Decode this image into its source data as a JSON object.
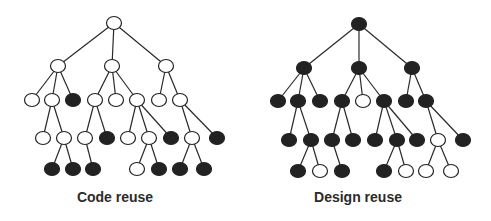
{
  "colors": {
    "filled": "#222222",
    "empty": "#ffffff",
    "edge": "#2a2a2a"
  },
  "node_rx": 7.5,
  "node_ry": 6.5,
  "trees": [
    {
      "id": "code-reuse",
      "caption": "Code reuse",
      "caption_center_x": 115,
      "nodes": [
        {
          "id": "r",
          "x": 114,
          "y": 23,
          "filled": false
        },
        {
          "id": "A",
          "x": 58,
          "y": 66,
          "filled": false,
          "parent": "r"
        },
        {
          "id": "B",
          "x": 112,
          "y": 66,
          "filled": false,
          "parent": "r"
        },
        {
          "id": "C",
          "x": 166,
          "y": 66,
          "filled": false,
          "parent": "r"
        },
        {
          "id": "A1",
          "x": 32,
          "y": 100,
          "filled": false,
          "parent": "A"
        },
        {
          "id": "A2",
          "x": 52,
          "y": 100,
          "filled": false,
          "parent": "A"
        },
        {
          "id": "A3",
          "x": 73,
          "y": 100,
          "filled": true,
          "parent": "A"
        },
        {
          "id": "B1",
          "x": 95,
          "y": 100,
          "filled": false,
          "parent": "B"
        },
        {
          "id": "B2",
          "x": 116,
          "y": 100,
          "filled": false,
          "parent": "B"
        },
        {
          "id": "B3",
          "x": 137,
          "y": 100,
          "filled": false,
          "parent": "B"
        },
        {
          "id": "C1",
          "x": 159,
          "y": 100,
          "filled": false,
          "parent": "C"
        },
        {
          "id": "C2",
          "x": 180,
          "y": 100,
          "filled": false,
          "parent": "C"
        },
        {
          "id": "A2a",
          "x": 43,
          "y": 138,
          "filled": false,
          "parent": "A2"
        },
        {
          "id": "A2b",
          "x": 64,
          "y": 138,
          "filled": false,
          "parent": "A2"
        },
        {
          "id": "B1a",
          "x": 85,
          "y": 138,
          "filled": false,
          "parent": "B1"
        },
        {
          "id": "B1b",
          "x": 107,
          "y": 138,
          "filled": true,
          "parent": "B1"
        },
        {
          "id": "B3a",
          "x": 128,
          "y": 138,
          "filled": false,
          "parent": "B3"
        },
        {
          "id": "B3b",
          "x": 149,
          "y": 138,
          "filled": false,
          "parent": "B3"
        },
        {
          "id": "B3c",
          "x": 171,
          "y": 138,
          "filled": true,
          "parent": "B3"
        },
        {
          "id": "C2a",
          "x": 192,
          "y": 138,
          "filled": false,
          "parent": "C2"
        },
        {
          "id": "C2b",
          "x": 217,
          "y": 138,
          "filled": true,
          "parent": "C2"
        },
        {
          "id": "A2b1",
          "x": 52,
          "y": 169,
          "filled": true,
          "parent": "A2b"
        },
        {
          "id": "A2b2",
          "x": 73,
          "y": 169,
          "filled": true,
          "parent": "A2b"
        },
        {
          "id": "B1a1",
          "x": 93,
          "y": 169,
          "filled": true,
          "parent": "B1a"
        },
        {
          "id": "B3b1",
          "x": 137,
          "y": 169,
          "filled": false,
          "parent": "B3b"
        },
        {
          "id": "B3b2",
          "x": 159,
          "y": 169,
          "filled": true,
          "parent": "B3b"
        },
        {
          "id": "C2a1",
          "x": 180,
          "y": 169,
          "filled": true,
          "parent": "C2a"
        },
        {
          "id": "C2a2",
          "x": 204,
          "y": 169,
          "filled": true,
          "parent": "C2a"
        }
      ]
    },
    {
      "id": "design-reuse",
      "caption": "Design reuse",
      "caption_center_x": 358,
      "nodes": [
        {
          "id": "r",
          "x": 359,
          "y": 24,
          "filled": true
        },
        {
          "id": "A",
          "x": 304,
          "y": 68,
          "filled": true,
          "parent": "r"
        },
        {
          "id": "B",
          "x": 359,
          "y": 68,
          "filled": true,
          "parent": "r"
        },
        {
          "id": "C",
          "x": 412,
          "y": 68,
          "filled": true,
          "parent": "r"
        },
        {
          "id": "A1",
          "x": 278,
          "y": 101,
          "filled": true,
          "parent": "A"
        },
        {
          "id": "A2",
          "x": 298,
          "y": 101,
          "filled": true,
          "parent": "A"
        },
        {
          "id": "A3",
          "x": 320,
          "y": 101,
          "filled": true,
          "parent": "A"
        },
        {
          "id": "B1",
          "x": 342,
          "y": 101,
          "filled": true,
          "parent": "B"
        },
        {
          "id": "B2",
          "x": 363,
          "y": 101,
          "filled": false,
          "parent": "B"
        },
        {
          "id": "B3",
          "x": 384,
          "y": 101,
          "filled": true,
          "parent": "B"
        },
        {
          "id": "C1",
          "x": 406,
          "y": 101,
          "filled": true,
          "parent": "C"
        },
        {
          "id": "C2",
          "x": 426,
          "y": 101,
          "filled": true,
          "parent": "C"
        },
        {
          "id": "A2a",
          "x": 289,
          "y": 140,
          "filled": true,
          "parent": "A2"
        },
        {
          "id": "A2b",
          "x": 311,
          "y": 140,
          "filled": true,
          "parent": "A2"
        },
        {
          "id": "B1a",
          "x": 332,
          "y": 140,
          "filled": true,
          "parent": "B1"
        },
        {
          "id": "B1b",
          "x": 353,
          "y": 140,
          "filled": true,
          "parent": "B1"
        },
        {
          "id": "B3a",
          "x": 375,
          "y": 140,
          "filled": true,
          "parent": "B3"
        },
        {
          "id": "B3b",
          "x": 397,
          "y": 140,
          "filled": true,
          "parent": "B3"
        },
        {
          "id": "B3c",
          "x": 417,
          "y": 140,
          "filled": true,
          "parent": "B3"
        },
        {
          "id": "C2a",
          "x": 438,
          "y": 140,
          "filled": false,
          "parent": "C2"
        },
        {
          "id": "C2b",
          "x": 463,
          "y": 140,
          "filled": true,
          "parent": "C2"
        },
        {
          "id": "A2b1",
          "x": 298,
          "y": 171,
          "filled": true,
          "parent": "A2b"
        },
        {
          "id": "A2b2",
          "x": 320,
          "y": 171,
          "filled": false,
          "parent": "A2b"
        },
        {
          "id": "B1a1",
          "x": 342,
          "y": 171,
          "filled": true,
          "parent": "B1a"
        },
        {
          "id": "B3b1",
          "x": 384,
          "y": 171,
          "filled": true,
          "parent": "B3b"
        },
        {
          "id": "B3b2",
          "x": 406,
          "y": 171,
          "filled": false,
          "parent": "B3b"
        },
        {
          "id": "C2a1",
          "x": 426,
          "y": 171,
          "filled": false,
          "parent": "C2a"
        },
        {
          "id": "C2a2",
          "x": 451,
          "y": 171,
          "filled": false,
          "parent": "C2a"
        }
      ]
    }
  ]
}
